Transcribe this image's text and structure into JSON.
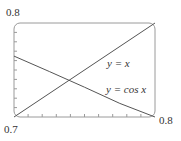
{
  "chart_data": {
    "type": "line",
    "title": "",
    "xlabel": "",
    "ylabel": "",
    "xlim": [
      0.7,
      0.8
    ],
    "ylim": [
      0.7,
      0.8
    ],
    "axis_labels": {
      "y_top": "0.8",
      "x_left": "0.7",
      "x_right": "0.8"
    },
    "series": [
      {
        "name": "y = x",
        "x": [
          0.7,
          0.8
        ],
        "y": [
          0.7,
          0.8
        ]
      },
      {
        "name": "y = cos x",
        "x": [
          0.7,
          0.725,
          0.75,
          0.775,
          0.8
        ],
        "y": [
          0.7648,
          0.7484,
          0.7317,
          0.7145,
          0.6967
        ]
      }
    ],
    "annotations": [
      {
        "text": "y = x",
        "x": 0.775,
        "y": 0.763
      },
      {
        "text": "y = cos x",
        "x": 0.775,
        "y": 0.728
      }
    ],
    "intersection": {
      "x": 0.739,
      "y": 0.739
    },
    "x_ticks_count": 10,
    "y_ticks_count": 10,
    "grid": false,
    "legend": false
  },
  "labels": {
    "y_top": "0.8",
    "x_left": "0.7",
    "x_right": "0.8",
    "line1": "y = x",
    "line2": "y = cos x"
  },
  "colors": {
    "frame": "#999999",
    "lines": "#555555",
    "text": "#333333"
  }
}
